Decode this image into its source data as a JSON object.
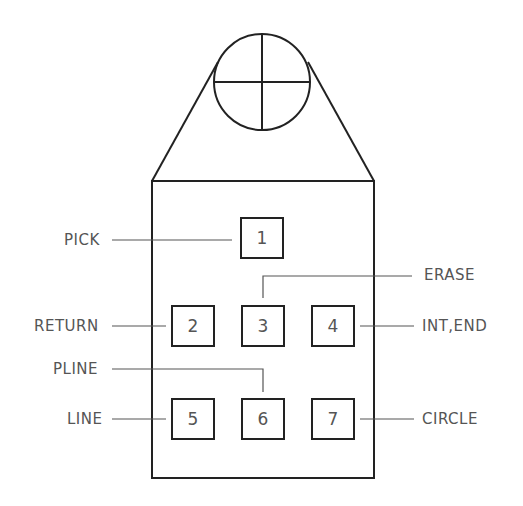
{
  "diagram": {
    "buttons": [
      {
        "number": "1",
        "label": "PICK"
      },
      {
        "number": "2",
        "label": "RETURN"
      },
      {
        "number": "3",
        "label": "ERASE"
      },
      {
        "number": "4",
        "label": "INT,END"
      },
      {
        "number": "5",
        "label": "LINE"
      },
      {
        "number": "6",
        "label": "PLINE"
      },
      {
        "number": "7",
        "label": "CIRCLE"
      }
    ],
    "caption_partial": "...t(cut off caption text)..."
  },
  "colors": {
    "stroke": "#222222",
    "text": "#555555",
    "background": "#ffffff"
  }
}
